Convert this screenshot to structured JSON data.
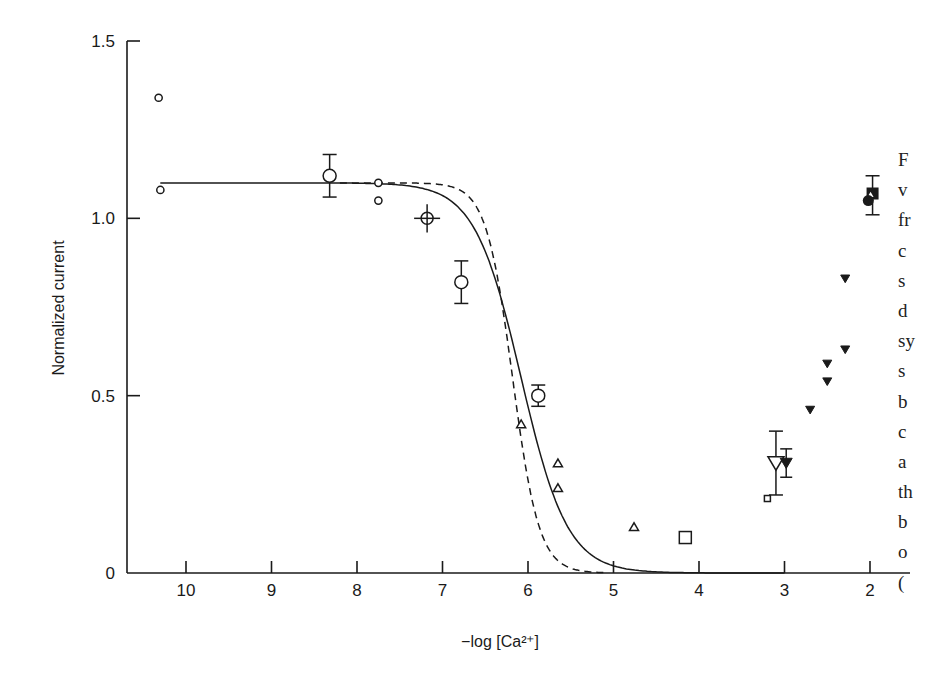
{
  "chart_data": {
    "type": "scatter",
    "title": "",
    "xlabel": "−log [Ca²⁺]",
    "ylabel": "Normalized current",
    "xlim": [
      10.7,
      1.55
    ],
    "ylim": [
      0,
      1.5
    ],
    "x_reversed": true,
    "x_ticks": [
      10,
      9,
      8,
      7,
      6,
      5,
      4,
      3,
      2
    ],
    "y_ticks": [
      {
        "value": 0,
        "label": "0"
      },
      {
        "value": 0.5,
        "label": "0.5"
      },
      {
        "value": 1.0,
        "label": "1.0"
      },
      {
        "value": 1.5,
        "label": "1.5"
      }
    ],
    "grid": false,
    "legend": "none",
    "curves": [
      {
        "name": "fit-solid",
        "style": "solid",
        "max": 1.1,
        "half": 6.08,
        "hill": 1.6
      },
      {
        "name": "fit-dashed",
        "style": "dashed",
        "max": 1.1,
        "half": 6.18,
        "hill": 2.8,
        "x_start": 8.2,
        "x_end": 5.1
      }
    ],
    "series": [
      {
        "name": "small open circles",
        "marker": "circle-small",
        "points": [
          {
            "x": 10.32,
            "y": 1.34
          },
          {
            "x": 10.3,
            "y": 1.08
          },
          {
            "x": 7.75,
            "y": 1.1
          },
          {
            "x": 7.75,
            "y": 1.05
          }
        ]
      },
      {
        "name": "large open circles with error",
        "marker": "circle-large",
        "points": [
          {
            "x": 8.32,
            "y": 1.12,
            "err_lo": 1.06,
            "err_hi": 1.18
          },
          {
            "x": 6.78,
            "y": 0.82,
            "err_lo": 0.76,
            "err_hi": 0.88
          },
          {
            "x": 5.88,
            "y": 0.5,
            "err_lo": 0.47,
            "err_hi": 0.53
          }
        ]
      },
      {
        "name": "crossed circle",
        "marker": "circle-cross",
        "points": [
          {
            "x": 7.18,
            "y": 1.0,
            "err_lo": 0.96,
            "err_hi": 1.04
          }
        ]
      },
      {
        "name": "open triangles",
        "marker": "triangle-open",
        "points": [
          {
            "x": 6.08,
            "y": 0.42
          },
          {
            "x": 5.65,
            "y": 0.31
          },
          {
            "x": 5.65,
            "y": 0.24
          },
          {
            "x": 4.76,
            "y": 0.13
          }
        ]
      },
      {
        "name": "open squares",
        "marker": "square-open",
        "points": [
          {
            "x": 4.16,
            "y": 0.1,
            "size": "large"
          },
          {
            "x": 3.2,
            "y": 0.21,
            "size": "small"
          }
        ]
      },
      {
        "name": "open inverted triangle",
        "marker": "invtriangle-open",
        "points": [
          {
            "x": 3.1,
            "y": 0.31,
            "err_lo": 0.22,
            "err_hi": 0.4
          }
        ]
      },
      {
        "name": "filled inverted triangles",
        "marker": "invtriangle-filled",
        "points": [
          {
            "x": 2.98,
            "y": 0.31,
            "err_lo": 0.27,
            "err_hi": 0.35
          },
          {
            "x": 2.7,
            "y": 0.46
          },
          {
            "x": 2.5,
            "y": 0.59
          },
          {
            "x": 2.5,
            "y": 0.54
          },
          {
            "x": 2.29,
            "y": 0.83
          },
          {
            "x": 2.29,
            "y": 0.63
          }
        ]
      },
      {
        "name": "cluster at pCa 2",
        "marker": "filled-cluster",
        "points": [
          {
            "x": 1.97,
            "y": 1.07,
            "err_lo": 1.01,
            "err_hi": 1.12,
            "shape": "square-filled"
          },
          {
            "x": 2.02,
            "y": 1.05,
            "shape": "circle-filled"
          }
        ]
      }
    ]
  },
  "caption_fragments": [
    "F",
    "v",
    "fr",
    "c",
    "s",
    "d",
    "sy",
    "s",
    "b",
    "c",
    "a",
    "th",
    "b",
    "o",
    "("
  ]
}
